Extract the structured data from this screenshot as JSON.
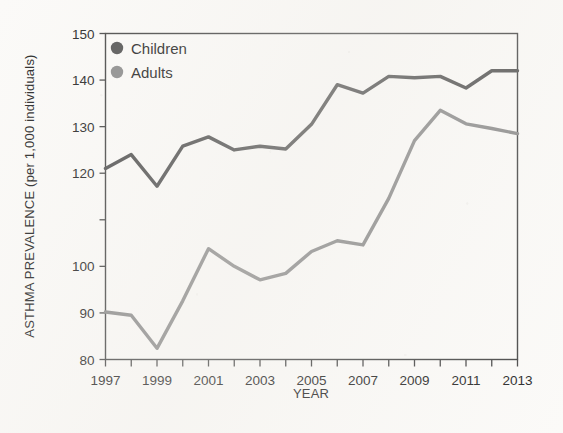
{
  "chart_data": {
    "type": "line",
    "title": "",
    "xlabel": "YEAR",
    "ylabel": "ASTHMA PREVALENCE (per 1,000 individuals)",
    "x": [
      1997,
      1998,
      1999,
      2000,
      2001,
      2002,
      2003,
      2004,
      2005,
      2006,
      2007,
      2008,
      2009,
      2010,
      2011,
      2012,
      2013
    ],
    "xlim": [
      1997,
      2013
    ],
    "ylim": [
      80,
      150
    ],
    "yticks": [
      80,
      90,
      100,
      110,
      120,
      130,
      140,
      150
    ],
    "ytick_labels": [
      "80",
      "90",
      "100",
      "",
      "120",
      "130",
      "140",
      "150"
    ],
    "xticks": [
      1997,
      1998,
      1999,
      2000,
      2001,
      2002,
      2003,
      2004,
      2005,
      2006,
      2007,
      2008,
      2009,
      2010,
      2011,
      2012,
      2013
    ],
    "xtick_labels": [
      "1997",
      "",
      "1999",
      "",
      "2001",
      "",
      "2003",
      "",
      "2005",
      "",
      "2007",
      "",
      "2009",
      "",
      "2011",
      "",
      "2013"
    ],
    "grid": false,
    "legend_position": "top-left",
    "y_axis_note": "Axis is broken/compressed between 100 and 120; tick spacing is uniform across 80,90,100,110,120,130,140,150.",
    "series": [
      {
        "name": "Children",
        "color": "#575757",
        "values": [
          121.0,
          124.0,
          117.2,
          125.8,
          127.8,
          125.0,
          125.8,
          125.2,
          130.5,
          139.0,
          137.2,
          140.8,
          140.5,
          140.8,
          138.3,
          142.0,
          142.0
        ]
      },
      {
        "name": "Adults",
        "color": "#8e8e8e",
        "values": [
          90.2,
          89.5,
          82.4,
          92.6,
          103.8,
          100.0,
          97.1,
          98.5,
          103.2,
          105.5,
          104.6,
          114.6,
          127.0,
          133.5,
          130.6,
          129.6,
          128.5
        ]
      }
    ]
  },
  "legend": {
    "items": [
      {
        "label": "Children",
        "color": "#575757"
      },
      {
        "label": "Adults",
        "color": "#8e8e8e"
      }
    ]
  },
  "axes": {
    "x_title": "YEAR",
    "y_title": "ASTHMA PREVALENCE (per 1,000 individuals)"
  }
}
